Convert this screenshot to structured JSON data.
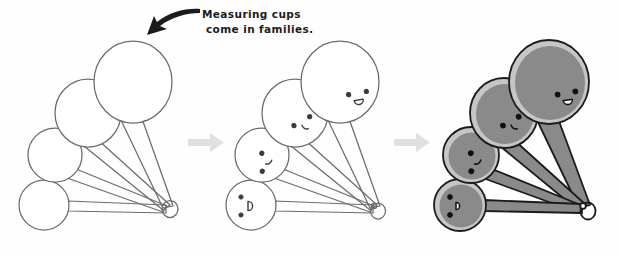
{
  "illustration": {
    "title": "Measuring cups drawing tutorial - three stages",
    "background_color": "#fefefe",
    "annotation": {
      "line1": "Measuring cups",
      "line2": "come in families.",
      "arrow_icon": "curved-arrow-down-left",
      "arrow_color": "#1b1b1b",
      "points_at": "largest-cup-stage-1"
    },
    "stage_separators": [
      {
        "icon": "arrow-right-icon",
        "color": "#e0e0e0"
      },
      {
        "icon": "arrow-right-icon",
        "color": "#e0e0e0"
      }
    ],
    "stages": [
      {
        "name": "stage-1-outline",
        "label": "Outline shapes only",
        "outline_color": "#6b6b6b",
        "fill_color": "none",
        "rim_color": "none",
        "has_faces": false,
        "cups": [
          {
            "size_label": "largest",
            "r": 39,
            "cx": 133,
            "cy": 82
          },
          {
            "size_label": "large",
            "r": 33,
            "cx": 88,
            "cy": 113
          },
          {
            "size_label": "medium",
            "r": 27,
            "cx": 55,
            "cy": 155
          },
          {
            "size_label": "small",
            "r": 25,
            "cx": 44,
            "cy": 205
          }
        ],
        "ring": {
          "cx": 171,
          "cy": 213,
          "r": 8
        }
      },
      {
        "name": "stage-2-faces",
        "label": "Faces added",
        "outline_color": "#6b6b6b",
        "fill_color": "none",
        "rim_color": "none",
        "has_faces": true,
        "cups": [
          {
            "size_label": "largest",
            "r": 39,
            "cx": 340,
            "cy": 82,
            "face": "smile-open",
            "face_rotation": -10
          },
          {
            "size_label": "large",
            "r": 33,
            "cx": 295,
            "cy": 113,
            "face": "smile-curve",
            "face_rotation": -10
          },
          {
            "size_label": "medium",
            "r": 27,
            "cx": 262,
            "cy": 155,
            "face": "smile-curve",
            "face_rotation": -70
          },
          {
            "size_label": "small",
            "r": 25,
            "cx": 251,
            "cy": 205,
            "face": "smile-open",
            "face_rotation": -90
          }
        ],
        "ring": {
          "cx": 378,
          "cy": 213,
          "r": 8
        }
      },
      {
        "name": "stage-3-colored",
        "label": "Shaded and inked",
        "outline_color": "#1b1b1b",
        "fill_color": "#8a8a8a",
        "rim_color": "#c6c6c6",
        "has_faces": true,
        "cups": [
          {
            "size_label": "largest",
            "r": 39,
            "cx": 549,
            "cy": 82,
            "face": "smile-open",
            "face_rotation": -10
          },
          {
            "size_label": "large",
            "r": 33,
            "cx": 504,
            "cy": 113,
            "face": "smile-curve",
            "face_rotation": -10
          },
          {
            "size_label": "medium",
            "r": 27,
            "cx": 471,
            "cy": 155,
            "face": "smile-curve",
            "face_rotation": -70
          },
          {
            "size_label": "small",
            "r": 25,
            "cx": 460,
            "cy": 205,
            "face": "smile-open",
            "face_rotation": -90
          }
        ],
        "ring": {
          "cx": 587,
          "cy": 213,
          "r": 8
        }
      }
    ],
    "colors": {
      "sketch_line": "#6b6b6b",
      "ink_line": "#1b1b1b",
      "cup_fill": "#8a8a8a",
      "cup_rim": "#c6c6c6",
      "handle_fill": "#8a8a8a",
      "separator": "#e0e0e0",
      "text": "#1b1b1b"
    }
  }
}
